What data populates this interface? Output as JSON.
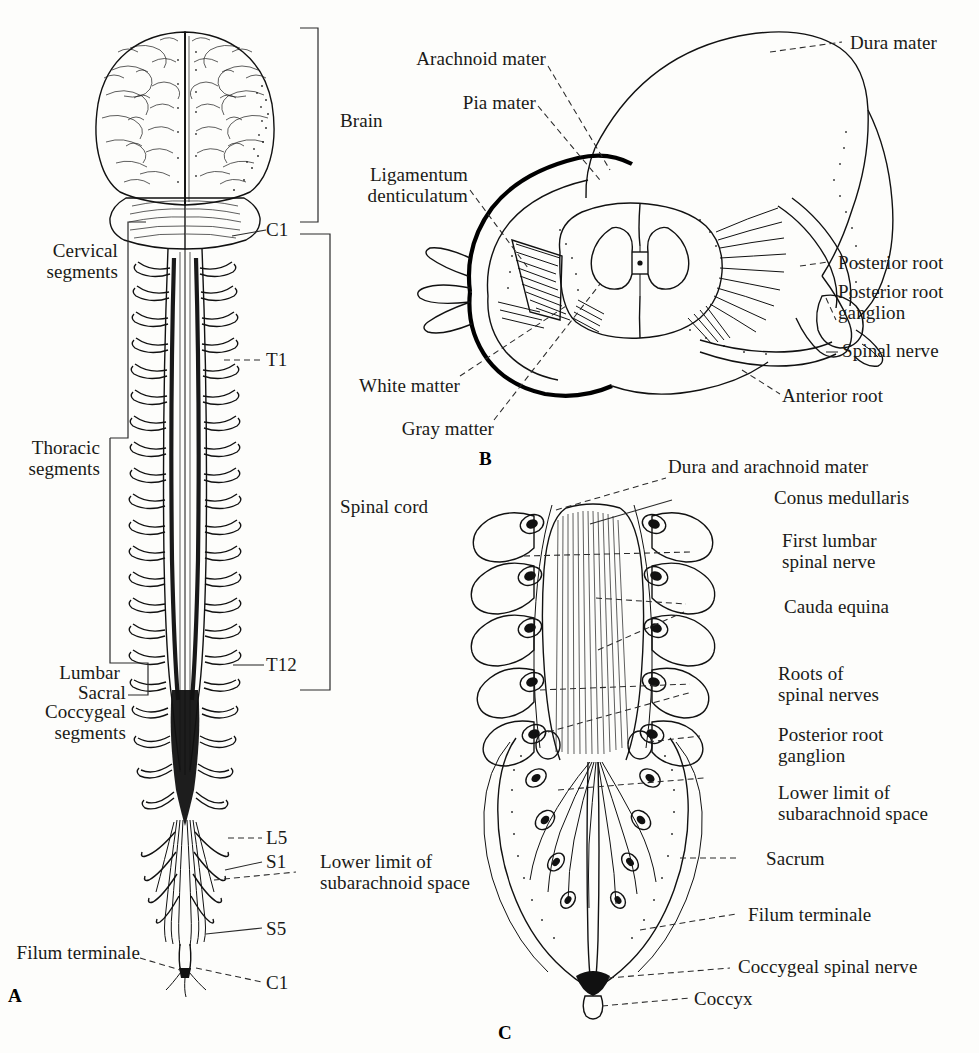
{
  "figure": {
    "background_color": "#fdfdfb",
    "ink_color": "#111111",
    "panels": [
      {
        "letter": "A",
        "caption": "Posterior view of brain and spinal cord with segmental levels"
      },
      {
        "letter": "B",
        "caption": "Oblique cutaway of spinal cord with meninges and nerve roots"
      },
      {
        "letter": "C",
        "caption": "Posterior view of lower vertebral canal, cauda equina and sacrum"
      }
    ]
  },
  "panel_a": {
    "letter": "A",
    "bracket_labels": [
      {
        "id": "brain",
        "text": "Brain"
      },
      {
        "id": "cervical",
        "text": "Cervical\nsegments"
      },
      {
        "id": "thoracic",
        "text": "Thoracic\nsegments"
      },
      {
        "id": "lumbar",
        "text": "Lumbar"
      },
      {
        "id": "sacral",
        "text": "Sacral"
      },
      {
        "id": "coccygeal",
        "text": "Coccygeal\nsegments"
      },
      {
        "id": "spinal-cord",
        "text": "Spinal cord"
      }
    ],
    "level_labels": [
      {
        "id": "c1-top",
        "text": "C1"
      },
      {
        "id": "t1",
        "text": "T1"
      },
      {
        "id": "t12",
        "text": "T12"
      },
      {
        "id": "l5",
        "text": "L5"
      },
      {
        "id": "s1",
        "text": "S1"
      },
      {
        "id": "s5",
        "text": "S5"
      },
      {
        "id": "c1-bottom",
        "text": "C1"
      }
    ],
    "callouts": [
      {
        "id": "lower-limit",
        "text": "Lower limit of\nsubarachnoid space"
      },
      {
        "id": "filum-terminale",
        "text": "Filum terminale"
      }
    ]
  },
  "panel_b": {
    "letter": "B",
    "callouts": [
      {
        "id": "arachnoid-mater",
        "text": "Arachnoid mater"
      },
      {
        "id": "pia-mater",
        "text": "Pia mater"
      },
      {
        "id": "ligamentum-denticulatum",
        "text": "Ligamentum\ndenticulatum"
      },
      {
        "id": "dura-mater",
        "text": "Dura mater"
      },
      {
        "id": "posterior-root",
        "text": "Posterior root"
      },
      {
        "id": "posterior-root-ganglion",
        "text": "Posterior root\nganglion"
      },
      {
        "id": "spinal-nerve",
        "text": "Spinal nerve"
      },
      {
        "id": "anterior-root",
        "text": "Anterior root"
      },
      {
        "id": "white-matter",
        "text": "White matter"
      },
      {
        "id": "gray-matter",
        "text": "Gray matter"
      }
    ]
  },
  "panel_c": {
    "letter": "C",
    "callouts": [
      {
        "id": "dura-and-arachnoid-mater",
        "text": "Dura and arachnoid mater"
      },
      {
        "id": "conus-medullaris",
        "text": "Conus medullaris"
      },
      {
        "id": "first-lumbar-spinal-nerve",
        "text": "First lumbar\nspinal nerve"
      },
      {
        "id": "cauda-equina",
        "text": "Cauda equina"
      },
      {
        "id": "roots-of-spinal-nerves",
        "text": "Roots of\nspinal nerves"
      },
      {
        "id": "posterior-root-ganglion",
        "text": "Posterior root\nganglion"
      },
      {
        "id": "lower-limit-subarachnoid",
        "text": "Lower limit of\nsubarachnoid space"
      },
      {
        "id": "sacrum",
        "text": "Sacrum"
      },
      {
        "id": "filum-terminale",
        "text": "Filum terminale"
      },
      {
        "id": "coccygeal-spinal-nerve",
        "text": "Coccygeal spinal nerve"
      },
      {
        "id": "coccyx",
        "text": "Coccyx"
      }
    ]
  }
}
